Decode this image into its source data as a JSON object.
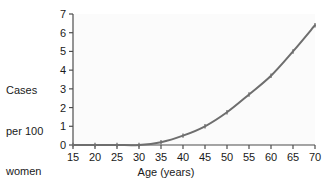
{
  "chart_data": {
    "type": "line",
    "title": "",
    "xlabel": "Age (years)",
    "ylabel": "Cases per 100 women",
    "ylabel_lines": [
      "Cases",
      "per 100",
      "women"
    ],
    "x": [
      15,
      20,
      25,
      30,
      35,
      40,
      45,
      50,
      55,
      60,
      65,
      70
    ],
    "values": [
      0,
      0,
      0,
      0,
      0.15,
      0.5,
      1.0,
      1.75,
      2.7,
      3.7,
      5.0,
      6.4
    ],
    "series": [
      {
        "name": "Cases per 100 women",
        "values": [
          0,
          0,
          0,
          0,
          0.15,
          0.5,
          1.0,
          1.75,
          2.7,
          3.7,
          5.0,
          6.4
        ],
        "color": "#6e6e6e"
      }
    ],
    "xlim": [
      15,
      70
    ],
    "ylim": [
      0,
      7
    ],
    "xticks": [
      15,
      20,
      25,
      30,
      35,
      40,
      45,
      50,
      55,
      60,
      65,
      70
    ],
    "yticks": [
      0,
      1,
      2,
      3,
      4,
      5,
      6,
      7
    ],
    "xtick_labels": [
      "15",
      "20",
      "25",
      "30",
      "35",
      "40",
      "45",
      "50",
      "55",
      "60",
      "65",
      "70"
    ],
    "ytick_labels": [
      "0",
      "1",
      "2",
      "3",
      "4",
      "5",
      "6",
      "7"
    ],
    "grid": false,
    "legend": false,
    "legend_position": "none",
    "markers": true,
    "plot_background": "#fbfbfb",
    "axis_color": "#4d4d4d",
    "line_color": "#6e6e6e"
  }
}
